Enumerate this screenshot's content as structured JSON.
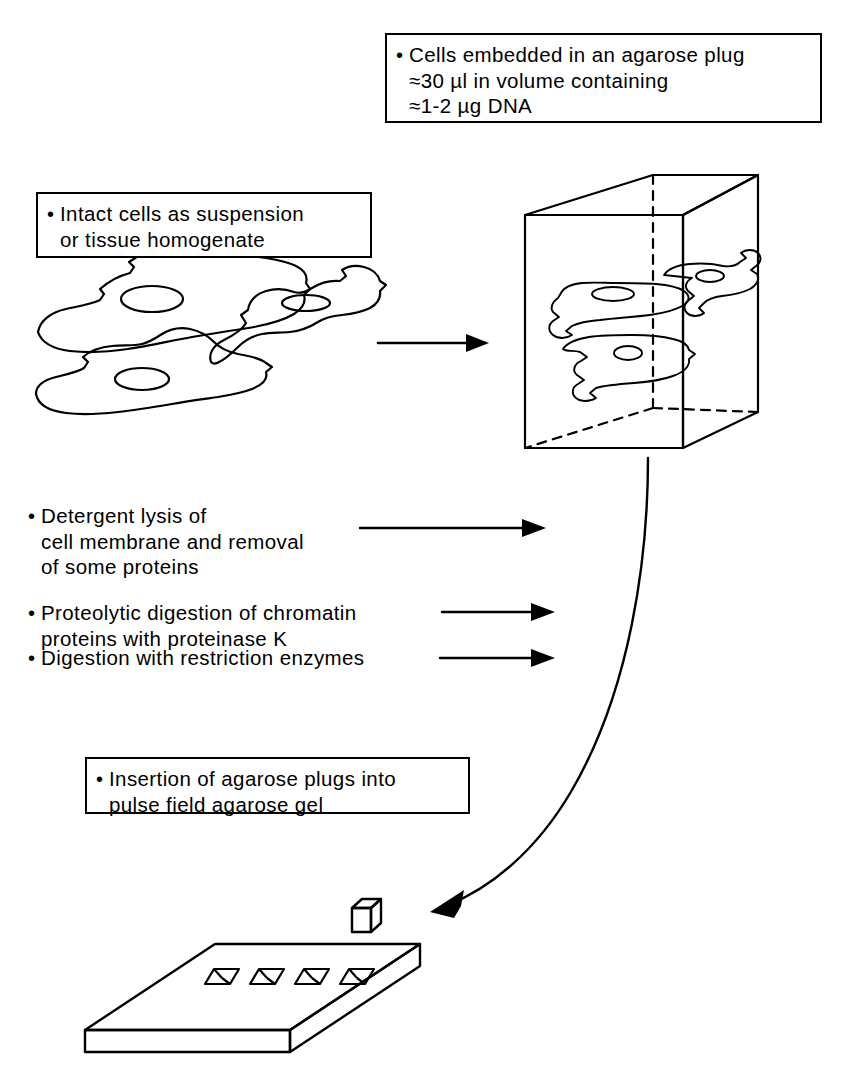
{
  "figure": {
    "ink_color": "#000000",
    "background_color": "#ffffff"
  },
  "callouts": {
    "plug": {
      "name": "agarose-plug-callout",
      "lines": [
        "Cells embedded in an agarose plug",
        "≈30 µl in volume containing",
        "≈1-2 µg DNA"
      ]
    },
    "intact_cells": {
      "name": "intact-cells-callout",
      "lines": [
        "Intact cells as suspension",
        "or tissue homogenate"
      ]
    },
    "insertion": {
      "name": "insertion-callout",
      "lines": [
        "Insertion of agarose plugs into",
        "pulse field agarose gel"
      ]
    }
  },
  "steps": [
    {
      "id": "detergent-lysis",
      "lines": [
        "Detergent lysis of",
        "cell membrane and removal",
        "of some proteins"
      ]
    },
    {
      "id": "proteolytic-digestion",
      "lines": [
        "Proteolytic digestion of chromatin",
        "proteins with proteinase K"
      ]
    },
    {
      "id": "restriction-digestion",
      "lines": [
        "Digestion with restriction enzymes"
      ]
    }
  ],
  "illustrations": {
    "cells": {
      "name": "suspended-cells-drawing",
      "count": 3,
      "description": "Three amoeboid cells each with an elliptical nucleus"
    },
    "agarose_block": {
      "name": "agarose-block-drawing",
      "description": "Transparent rectangular agarose block with dashed hidden edges containing three embedded cells",
      "embedded_cell_count": 3
    },
    "gel_slab": {
      "name": "pulsed-field-gel-drawing",
      "description": "Isometric agarose gel slab with loading wells",
      "well_count": 4
    },
    "loose_plug": {
      "name": "agarose-plug-drawing",
      "description": "Single small agarose plug above the gel wells"
    }
  },
  "arrows": [
    {
      "id": "cells-to-block-arrow",
      "style": "straight"
    },
    {
      "id": "detergent-lysis-arrow",
      "style": "straight"
    },
    {
      "id": "proteolytic-digestion-arrow",
      "style": "straight"
    },
    {
      "id": "restriction-digestion-arrow",
      "style": "straight"
    },
    {
      "id": "block-to-gel-arrow",
      "style": "curved"
    }
  ]
}
